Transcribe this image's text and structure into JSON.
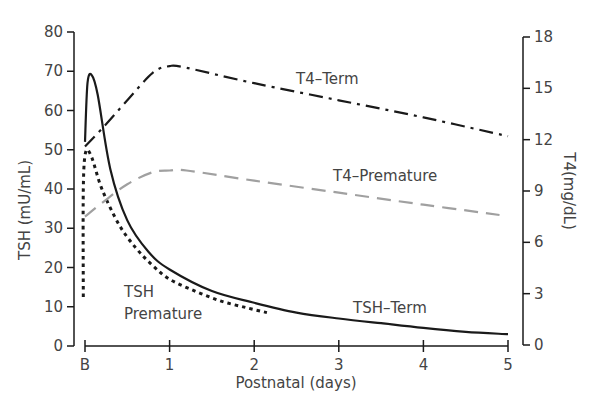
{
  "chart_data": {
    "type": "line",
    "title": "",
    "xlabel": "Postnatal (days)",
    "ylabel": "TSH (mU/mL)",
    "ylabel_right": "T4(mg/dL)",
    "x_ticks": [
      "B",
      "1",
      "2",
      "3",
      "4",
      "5"
    ],
    "y_ticks_left": [
      0,
      10,
      20,
      30,
      40,
      50,
      60,
      70,
      80
    ],
    "y_ticks_right": [
      0,
      3,
      6,
      9,
      12,
      15,
      18
    ],
    "xlim": [
      0,
      5
    ],
    "ylim_left": [
      0,
      80
    ],
    "ylim_right": [
      0,
      18
    ],
    "grid": false,
    "legend": "inline annotations",
    "series": [
      {
        "name": "TSH–Term",
        "axis": "left",
        "style": "solid",
        "color": "#1a1a1a",
        "x": [
          0,
          0.03,
          0.08,
          0.15,
          0.3,
          0.5,
          0.75,
          1,
          1.5,
          2,
          2.5,
          3,
          3.5,
          4,
          4.5,
          5
        ],
        "values": [
          52,
          67,
          69,
          64,
          45,
          32,
          24,
          19.5,
          14,
          11,
          8.5,
          7,
          5.8,
          4.6,
          3.6,
          3
        ]
      },
      {
        "name": "TSH Premature",
        "axis": "left",
        "style": "dotted",
        "color": "#1a1a1a",
        "x": [
          -0.02,
          -0.02,
          0.01,
          0.08,
          0.2,
          0.4,
          0.6,
          0.8,
          1,
          1.3,
          1.6,
          1.9,
          2.15
        ],
        "values": [
          12.5,
          40,
          49.5,
          48,
          40,
          31,
          25,
          20.5,
          17,
          14,
          11.5,
          9.8,
          8.5
        ]
      },
      {
        "name": "T4–Term",
        "axis": "right",
        "style": "dash-dot",
        "color": "#1a1a1a",
        "x": [
          0,
          0.23,
          0.5,
          0.8,
          1,
          1.2,
          2,
          3,
          4,
          5
        ],
        "values": [
          11.6,
          12.8,
          14.3,
          15.9,
          16.3,
          16.2,
          15.3,
          14.3,
          13.3,
          12.2
        ]
      },
      {
        "name": "T4–Premature",
        "axis": "right",
        "style": "dashed",
        "color": "#a0a0a0",
        "x": [
          0,
          0.2,
          0.5,
          0.8,
          1,
          1.2,
          2,
          3,
          4,
          4.9
        ],
        "values": [
          7.5,
          8.3,
          9.4,
          10.1,
          10.2,
          10.2,
          9.6,
          8.9,
          8.2,
          7.6
        ]
      }
    ],
    "annotations": [
      {
        "text": "T4–Term",
        "x": 3.0,
        "y_right": 15.8
      },
      {
        "text": "T4–Premature",
        "x": 2.95,
        "y_right": 9.9
      },
      {
        "text": "TSH",
        "x": 0.45,
        "y_left": 13
      },
      {
        "text": "Premature",
        "x": 0.45,
        "y_left": 7.5
      },
      {
        "text": "TSH–Term",
        "x": 2.65,
        "y_left": 8
      }
    ]
  },
  "labels": {
    "xlabel": "Postnatal (days)",
    "ylabel_left": "TSH (mU/mL)",
    "ylabel_right": "T4(mg/dL)",
    "ann_t4_term": "T4–Term",
    "ann_t4_premature": "T4–Premature",
    "ann_tsh_1": "TSH",
    "ann_tsh_2": "Premature",
    "ann_tsh_term": "TSH–Term"
  }
}
